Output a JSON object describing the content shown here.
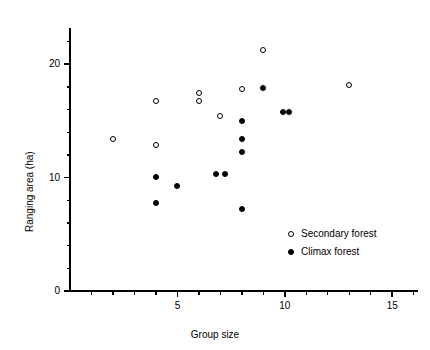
{
  "chart_data": {
    "type": "scatter",
    "title": "",
    "xlabel": "Group size",
    "ylabel": "Ranging area (ha)",
    "xlim": [
      0,
      16.2
    ],
    "ylim": [
      0,
      23.2
    ],
    "xticks": [
      5,
      10,
      15
    ],
    "xtick_labels": [
      "5",
      "10",
      "15"
    ],
    "xminor_ticks": [
      1,
      2,
      3,
      4,
      6,
      7,
      8,
      9,
      11,
      12,
      13,
      14,
      16
    ],
    "yticks": [
      0,
      10,
      20
    ],
    "ytick_labels": [
      "0",
      "10",
      "20"
    ],
    "yminor_ticks": [
      2,
      4,
      6,
      8,
      12,
      14,
      16,
      18,
      22
    ],
    "grid": false,
    "legend_position": "lower right",
    "series": [
      {
        "name": "Secondary forest",
        "marker": "open-circle",
        "color": "#000000",
        "points": [
          {
            "x": 2.0,
            "y": 13.4
          },
          {
            "x": 4.0,
            "y": 16.8
          },
          {
            "x": 4.0,
            "y": 12.9
          },
          {
            "x": 6.0,
            "y": 17.5
          },
          {
            "x": 6.0,
            "y": 16.8
          },
          {
            "x": 7.0,
            "y": 15.4
          },
          {
            "x": 8.0,
            "y": 17.8
          },
          {
            "x": 9.0,
            "y": 21.3
          },
          {
            "x": 13.0,
            "y": 18.2
          }
        ]
      },
      {
        "name": "Climax forest",
        "marker": "filled-circle",
        "color": "#000000",
        "points": [
          {
            "x": 4.0,
            "y": 10.1
          },
          {
            "x": 4.0,
            "y": 7.8
          },
          {
            "x": 5.0,
            "y": 9.3
          },
          {
            "x": 6.8,
            "y": 10.3
          },
          {
            "x": 7.2,
            "y": 10.3
          },
          {
            "x": 8.0,
            "y": 15.0
          },
          {
            "x": 8.0,
            "y": 13.4
          },
          {
            "x": 8.0,
            "y": 12.3
          },
          {
            "x": 8.0,
            "y": 7.2
          },
          {
            "x": 9.0,
            "y": 17.9
          },
          {
            "x": 9.9,
            "y": 15.8
          },
          {
            "x": 10.2,
            "y": 15.8
          }
        ]
      }
    ]
  },
  "legend": {
    "items": [
      {
        "label": "Secondary forest",
        "marker": "open-circle"
      },
      {
        "label": "Climax forest",
        "marker": "filled-circle"
      }
    ]
  }
}
